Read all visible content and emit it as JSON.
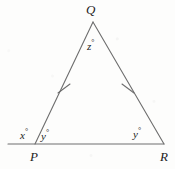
{
  "figure": {
    "name": "isosceles-triangle-exterior-angle",
    "background_color": "#fdfdfc",
    "stroke_color": "#6e6e6e",
    "text_color": "#1c1c1c",
    "width": 175,
    "height": 169,
    "vertices": {
      "Q": {
        "label": "Q",
        "x": 93,
        "y": 22
      },
      "P": {
        "label": "P",
        "x": 35,
        "y": 144
      },
      "R": {
        "label": "R",
        "x": 164,
        "y": 144
      }
    },
    "base_extension": {
      "from_x": 8,
      "to_x": 35,
      "y": 144
    },
    "tick_marks": [
      {
        "name": "tick-left-leg",
        "x": 64,
        "y": 88
      },
      {
        "name": "tick-right-leg",
        "x": 128,
        "y": 88
      }
    ],
    "angles": {
      "apex": {
        "value": "z",
        "degree": "°"
      },
      "exterior_at_p": {
        "value": "x",
        "degree": "°"
      },
      "interior_at_p": {
        "value": "y",
        "degree": "°"
      },
      "interior_at_r": {
        "value": "y",
        "degree": "°"
      }
    }
  }
}
